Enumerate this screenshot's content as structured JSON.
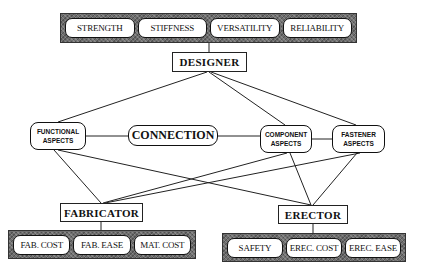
{
  "diagram": {
    "criteria_banner": {
      "items": [
        "STRENGTH",
        "STIFFNESS",
        "VERSATILITY",
        "RELIABILITY"
      ]
    },
    "designer": {
      "label": "DESIGNER"
    },
    "aspects": {
      "functional": {
        "line1": "FUNCTIONAL",
        "line2": "ASPECTS"
      },
      "connection": {
        "label": "CONNECTION"
      },
      "component": {
        "line1": "COMPONENT",
        "line2": "ASPECTS"
      },
      "fastener": {
        "line1": "FASTENER",
        "line2": "ASPECTS"
      }
    },
    "fabricator": {
      "label": "FABRICATOR",
      "items": [
        "FAB. COST",
        "FAB. EASE",
        "MAT. COST"
      ]
    },
    "erector": {
      "label": "ERECTOR",
      "items": [
        "SAFETY",
        "EREC. COST",
        "EREC. EASE"
      ]
    },
    "colors": {
      "banner_fill": "#6e6e6e",
      "line": "#222222",
      "box_fill": "#ffffff"
    }
  }
}
